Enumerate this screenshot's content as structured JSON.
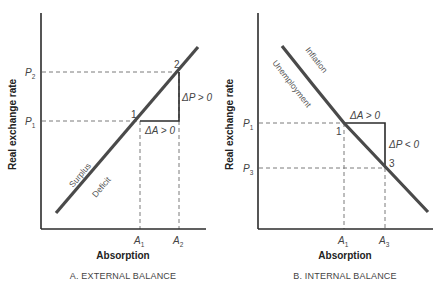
{
  "panels": [
    {
      "id": "A",
      "caption": "A. EXTERNAL BALANCE",
      "xlabel": "Absorption",
      "ylabel": "Real exchange rate",
      "curve_labels": {
        "above": "Surplus",
        "below": "Deficit"
      },
      "y_ticks": [
        {
          "base": "P",
          "sub": "2"
        },
        {
          "base": "P",
          "sub": "1"
        }
      ],
      "x_ticks": [
        {
          "base": "A",
          "sub": "1"
        },
        {
          "base": "A",
          "sub": "2"
        }
      ],
      "points": [
        "1",
        "2"
      ],
      "delta_h": "ΔA > 0",
      "delta_v": "ΔP > 0"
    },
    {
      "id": "B",
      "caption": "B. INTERNAL BALANCE",
      "xlabel": "Absorption",
      "ylabel": "Real exchange rate",
      "curve_labels": {
        "above": "Inflation",
        "below": "Unemployment"
      },
      "y_ticks": [
        {
          "base": "P",
          "sub": "1"
        },
        {
          "base": "P",
          "sub": "3"
        }
      ],
      "x_ticks": [
        {
          "base": "A",
          "sub": "1"
        },
        {
          "base": "A",
          "sub": "3"
        }
      ],
      "points": [
        "1",
        "3"
      ],
      "delta_h": "ΔA > 0",
      "delta_v": "ΔP < 0"
    }
  ],
  "colors": {
    "axis": "#2b2b2b",
    "curve": "#4a4a4a",
    "dash": "#7a7a7a",
    "text": "#444444"
  }
}
